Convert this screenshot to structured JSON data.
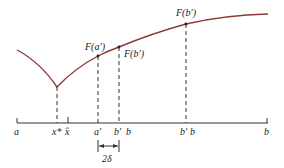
{
  "diagram": {
    "colors": {
      "curve": "#8b3a3a",
      "axis": "#333333",
      "dashed": "#333333",
      "text": "#222222"
    },
    "curve_labels": {
      "f_a_prime": "F(a′)",
      "f_b_prime_low": "F(b′)",
      "f_b_prime_high": "F(b′)"
    },
    "axis_labels": {
      "a": "a",
      "x_star": "x*",
      "x_hat": "x̂",
      "a_prime": "a′",
      "b_prime": "b′",
      "b": "b",
      "b_prime_2": "b′",
      "b_2": "b",
      "b_end": "b"
    },
    "interval_label": "2δ"
  }
}
